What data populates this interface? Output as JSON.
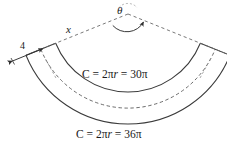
{
  "figure": {
    "type": "annulus-sector-geometry-diagram",
    "background_color": "#ffffff",
    "stroke_color": "#3a3a3a"
  },
  "labels": {
    "angle": "θ",
    "radius": "x",
    "width": "4",
    "inner_circumference": "C = 2π",
    "inner_circumference_var": "r",
    "inner_circumference_value": " = 30π",
    "outer_circumference": "C = 2π",
    "outer_circumference_var": "r",
    "outer_circumference_value": " = 36π",
    "inner_circumference_full": "C = 2πr = 30π",
    "outer_circumference_full": "C = 2πr = 36π"
  },
  "geometry": {
    "apex_x": 128,
    "apex_y": 14,
    "inner_radius_px": 78,
    "outer_radius_px": 110,
    "dashed_mid_radius_px": 94,
    "sector_start_angle_deg": 158,
    "sector_end_angle_deg": 22
  },
  "values": {
    "inner_circumference_numeric": "30π",
    "outer_circumference_numeric": "36π",
    "band_width": "4",
    "inner_radius_derived": "15",
    "outer_radius_derived": "18"
  }
}
